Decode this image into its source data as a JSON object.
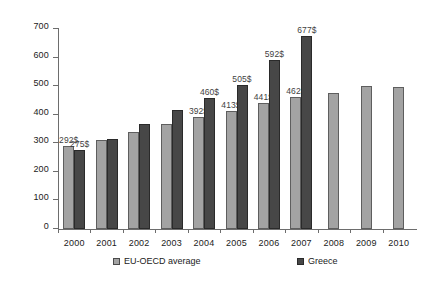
{
  "chart_data": {
    "type": "bar",
    "title": "",
    "subtitle": "",
    "xlabel": "",
    "ylabel": "",
    "ylim": [
      0,
      700
    ],
    "ytick_interval": 100,
    "yticks": [
      0,
      100,
      200,
      300,
      400,
      500,
      600,
      700
    ],
    "grid": false,
    "legend_position": "bottom",
    "categories": [
      "2000",
      "2001",
      "2002",
      "2003",
      "2004",
      "2005",
      "2006",
      "2007",
      "2008",
      "2009",
      "2010"
    ],
    "series": [
      {
        "name": "EU-OECD average",
        "color": "#a3a3a3",
        "values": [
          292,
          312,
          340,
          367,
          392,
          413,
          441,
          462,
          475,
          500,
          497
        ],
        "labels": [
          "292$",
          "",
          "",
          "",
          "392$",
          "413$",
          "441$",
          "462$",
          "",
          "",
          ""
        ]
      },
      {
        "name": "Greece",
        "color": "#474747",
        "values": [
          275,
          315,
          366,
          415,
          460,
          505,
          592,
          677,
          null,
          null,
          null
        ],
        "labels": [
          "275$",
          "",
          "",
          "",
          "460$",
          "505$",
          "592$",
          "677$",
          "",
          "",
          ""
        ]
      }
    ]
  },
  "legend": {
    "items": [
      {
        "label": "EU-OECD average",
        "swatch": "light"
      },
      {
        "label": "Greece",
        "swatch": "dark"
      }
    ]
  },
  "colors": {
    "eu_oecd_average": "#a3a3a3",
    "greece": "#474747",
    "axis": "#6d6d6d",
    "text": "#1b1b1b",
    "background": "#ffffff"
  }
}
